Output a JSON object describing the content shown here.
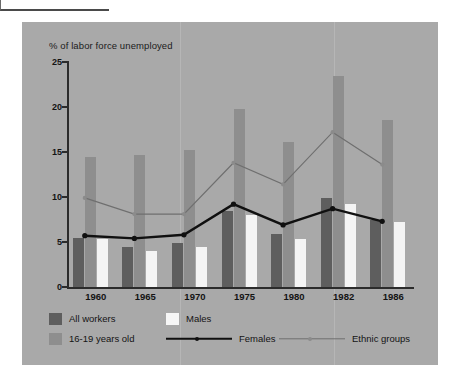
{
  "chart_data": {
    "type": "bar",
    "title": "% of labor force unemployed",
    "xlabel": "",
    "ylabel": "% of labor force unemployed",
    "ylim": [
      0,
      25
    ],
    "yticks": [
      0,
      5,
      10,
      15,
      20,
      25
    ],
    "grid": false,
    "legend_position": "bottom",
    "categories": [
      "1960",
      "1965",
      "1970",
      "1975",
      "1980",
      "1982",
      "1986"
    ],
    "series": [
      {
        "name": "All workers",
        "kind": "bar",
        "color": "#5e5e5e",
        "values": [
          5.5,
          4.4,
          4.9,
          8.5,
          5.9,
          9.9,
          7.4
        ]
      },
      {
        "name": "16-19 years old",
        "kind": "bar",
        "color": "#8e8e8e",
        "values": [
          14.4,
          14.7,
          15.2,
          19.8,
          16.1,
          23.5,
          18.6
        ]
      },
      {
        "name": "Males",
        "kind": "bar",
        "color": "#f4f4f4",
        "values": [
          5.3,
          4.0,
          4.5,
          8.0,
          5.3,
          9.2,
          7.2
        ]
      },
      {
        "name": "Females",
        "kind": "line",
        "color": "#101010",
        "values": [
          5.7,
          5.4,
          5.8,
          9.2,
          6.9,
          8.7,
          7.3
        ]
      },
      {
        "name": "Ethnic groups",
        "kind": "line",
        "color": "#6f6f6f",
        "values": [
          9.9,
          8.1,
          8.1,
          13.8,
          11.4,
          17.2,
          13.6
        ]
      }
    ]
  },
  "legend": {
    "items": [
      {
        "label": "All workers"
      },
      {
        "label": "Males"
      },
      {
        "label": "16-19 years old"
      },
      {
        "label": "Females"
      },
      {
        "label": "Ethnic groups"
      }
    ]
  },
  "colors": {
    "panel_background": "#a9a9a9",
    "page_background": "#ffffff",
    "axis": "#2b2b2b",
    "bar_all_workers": "#5e5e5e",
    "bar_teens": "#8e8e8e",
    "bar_males": "#f4f4f4",
    "line_females": "#101010",
    "line_ethnic": "#6f6f6f"
  }
}
